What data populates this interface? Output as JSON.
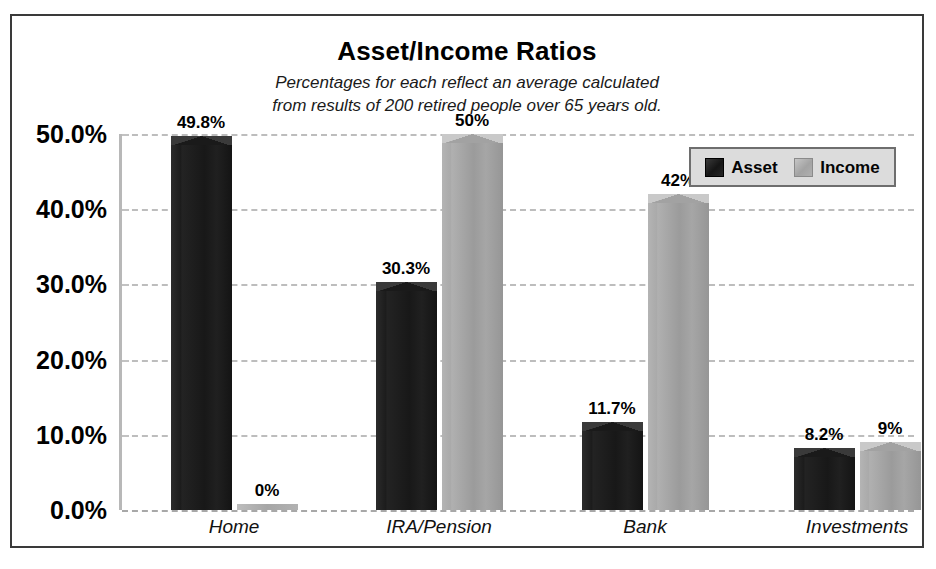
{
  "chart_data": {
    "type": "bar",
    "title": "Asset/Income Ratios",
    "subtitle_line1": "Percentages for each reflect an average calculated",
    "subtitle_line2": "from results of 200 retired people over 65 years old.",
    "categories": [
      "Home",
      "IRA/Pension",
      "Bank",
      "Investments"
    ],
    "series": [
      {
        "name": "Asset",
        "color": "#1a1a1a",
        "values": [
          49.8,
          30.3,
          11.7,
          8.2
        ],
        "labels": [
          "49.8%",
          "30.3%",
          "11.7%",
          "8.2%"
        ]
      },
      {
        "name": "Income",
        "color": "#a3a3a3",
        "values": [
          0,
          50,
          42,
          9
        ],
        "labels": [
          "0%",
          "50%",
          "42%",
          "9%"
        ]
      }
    ],
    "xlabel": "",
    "ylabel": "",
    "ylim": [
      0,
      50
    ],
    "yticks": [
      0,
      10,
      20,
      30,
      40,
      50
    ],
    "ytick_labels": [
      "0.0%",
      "10.0%",
      "20.0%",
      "30.0%",
      "40.0%",
      "50.0%"
    ],
    "grid": true,
    "grid_style": "dashed-horizontal",
    "legend_position": "top-right",
    "legend_entries": [
      "Asset",
      "Income"
    ]
  }
}
